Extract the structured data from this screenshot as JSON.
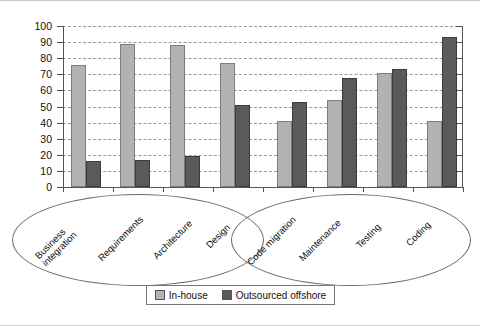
{
  "chart_data": {
    "type": "bar",
    "title": "",
    "xlabel": "",
    "ylabel": "Percent",
    "ylim": [
      0,
      100
    ],
    "ytick_step": 10,
    "yticks": [
      0,
      10,
      20,
      30,
      40,
      50,
      60,
      70,
      80,
      90,
      100
    ],
    "grid": true,
    "legend_position": "bottom",
    "categories": [
      "Business integration",
      "Requirements",
      "Architecture",
      "Design",
      "Code migration",
      "Maintenance",
      "Testing",
      "Coding"
    ],
    "series": [
      {
        "name": "In-house",
        "color": "#b2b2b2",
        "values": [
          76,
          89,
          88,
          77,
          41,
          54,
          71,
          41
        ]
      },
      {
        "name": "Outsourced offshore",
        "color": "#5a5a5a",
        "values": [
          16,
          17,
          19,
          51,
          53,
          68,
          73,
          93
        ]
      }
    ],
    "groups": [
      {
        "label": "",
        "categories": [
          "Business integration",
          "Requirements",
          "Architecture",
          "Design"
        ]
      },
      {
        "label": "",
        "categories": [
          "Code migration",
          "Maintenance",
          "Testing",
          "Coding"
        ]
      }
    ]
  },
  "legend": {
    "items": [
      {
        "label": "In-house",
        "color": "#b2b2b2"
      },
      {
        "label": "Outsourced offshore",
        "color": "#5a5a5a"
      }
    ]
  },
  "axis": {
    "y_title": "Percent",
    "y_labels": [
      "100",
      "90",
      "80",
      "70",
      "60",
      "50",
      "40",
      "30",
      "20",
      "10",
      "0"
    ]
  },
  "category_labels": [
    "Business",
    "integration",
    "Requirements",
    "Architecture",
    "Design",
    "Code migration",
    "Maintenance",
    "Testing",
    "Coding"
  ]
}
